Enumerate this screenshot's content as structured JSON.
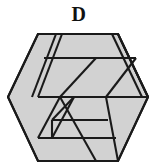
{
  "figure": {
    "label": "D",
    "kind": "hexagonal-spiral-ribbon",
    "colors": {
      "background": "#ffffff",
      "face_fill": "#d2d2d2",
      "outline": "#1a1a1a",
      "label_color": "#111111"
    },
    "outline_width": 2.1,
    "hexagon": {
      "center_x": 78,
      "center_y": 97,
      "radius": 71,
      "vertices": [
        [
          8,
          97
        ],
        [
          38,
          34
        ],
        [
          118,
          34
        ],
        [
          148,
          97
        ],
        [
          118,
          161
        ],
        [
          38,
          161
        ]
      ]
    },
    "faces": [
      {
        "name": "upper-left-outer-band",
        "points": "8,97 38,34 56,34 32,97"
      },
      {
        "name": "top-outer-band",
        "points": "38,34 118,34 143,87 62,87"
      },
      {
        "name": "upper-right-wedge",
        "points": "118,34 148,97 118,97 95,55"
      },
      {
        "name": "inner-upper-ribbon",
        "points": "56,34 148,97 110,97 44,57"
      },
      {
        "name": "center-left-band",
        "points": "32,97 62,97 38,150 8,97"
      },
      {
        "name": "lower-right-wedge",
        "points": "110,97 148,97 118,161 95,120"
      },
      {
        "name": "inner-lower-ribbon",
        "points": "62,97 118,161 38,161 24,136"
      },
      {
        "name": "inner-spiral-core",
        "points": "68,104 104,104 86,136 50,136"
      },
      {
        "name": "inner-spiral-tail",
        "points": "80,112 96,112 88,126 64,126"
      }
    ],
    "edges": [
      {
        "name": "hexagon-outline",
        "points": "8,97 38,34 118,34 148,97 118,161 38,161 8,97"
      },
      {
        "name": "fold-upper-left",
        "points": "56,34 32,97"
      },
      {
        "name": "fold-inner-top",
        "points": "44,57 135,57"
      },
      {
        "name": "fold-inner-diagonal-right",
        "points": "95,55 62,112"
      },
      {
        "name": "fold-mid-horizontal",
        "points": "32,97 148,97"
      },
      {
        "name": "fold-inner-left-v",
        "points": "62,97 38,150"
      },
      {
        "name": "fold-inner-mid-v",
        "points": "80,97 104,140"
      },
      {
        "name": "fold-spiral-outer",
        "points": "62,109 42,145"
      },
      {
        "name": "fold-spiral-inner",
        "points": "78,118 62,147"
      },
      {
        "name": "fold-bottom-step-1",
        "points": "52,122 120,122"
      },
      {
        "name": "fold-bottom-step-2",
        "points": "64,140 112,140"
      }
    ]
  }
}
